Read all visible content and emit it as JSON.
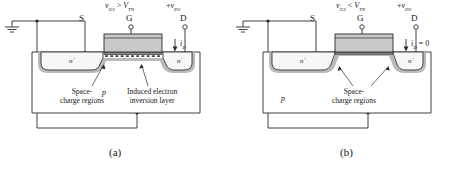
{
  "figure": {
    "type": "n-channel-enhancement-mosfet-cross-section",
    "panels": [
      {
        "id": "a",
        "caption": "(a)",
        "gate_bias": {
          "symbol": "v",
          "sub": "GS",
          "relation": ">",
          "threshold_symbol": "V",
          "threshold_sub": "TN",
          "full_text": "vGS > VTN"
        },
        "drain_bias": {
          "sign": "+",
          "symbol": "v",
          "sub": "DS",
          "full_text": "+vDS"
        },
        "terminals": [
          {
            "name": "S",
            "label": "S"
          },
          {
            "name": "G",
            "label": "G"
          },
          {
            "name": "D",
            "label": "D"
          }
        ],
        "current": {
          "symbol": "i",
          "sub": "D",
          "suffix": "",
          "full_text": "iD",
          "direction": "down"
        },
        "regions": [
          {
            "name": "source-diffusion",
            "label": "n",
            "sup": "+"
          },
          {
            "name": "drain-diffusion",
            "label": "n",
            "sup": "+"
          },
          {
            "name": "substrate",
            "label": "p"
          }
        ],
        "annotations": [
          {
            "name": "space-charge-regions",
            "line1": "Space-",
            "line2": "charge regions"
          },
          {
            "name": "inversion-layer",
            "line1": "Induced electron",
            "line2": "inversion layer"
          }
        ]
      },
      {
        "id": "b",
        "caption": "(b)",
        "gate_bias": {
          "symbol": "v",
          "sub": "GS",
          "relation": "<",
          "threshold_symbol": "V",
          "threshold_sub": "TN",
          "full_text": "vGS < VTN"
        },
        "drain_bias": {
          "sign": "+",
          "symbol": "v",
          "sub": "DS",
          "full_text": "+vDS"
        },
        "terminals": [
          {
            "name": "S",
            "label": "S"
          },
          {
            "name": "G",
            "label": "G"
          },
          {
            "name": "D",
            "label": "D"
          }
        ],
        "current": {
          "symbol": "i",
          "sub": "D",
          "suffix": " = 0",
          "full_text": "iD = 0",
          "direction": "down"
        },
        "regions": [
          {
            "name": "source-diffusion",
            "label": "n",
            "sup": "+"
          },
          {
            "name": "drain-diffusion",
            "label": "n",
            "sup": "+"
          },
          {
            "name": "substrate",
            "label": "p"
          }
        ],
        "annotations": [
          {
            "name": "space-charge-regions",
            "line1": "Space-",
            "line2": "charge regions"
          }
        ]
      }
    ],
    "colors": {
      "line": "#2a2a2a",
      "gate_fill": "#c9c9c9",
      "oxide_fill": "#8c8c8c",
      "depletion_fill": "#b9b9b9",
      "diffusion_fill": "#f2f2f2",
      "substrate_fill": "#ffffff",
      "inversion_fill": "#707070",
      "text": "#161616"
    }
  }
}
